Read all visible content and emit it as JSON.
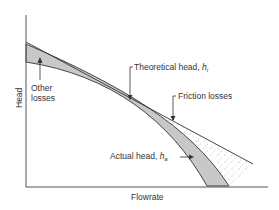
{
  "diagram": {
    "type": "pump performance curve",
    "axes": {
      "x_label": "Flowrate",
      "y_label": "Head"
    },
    "curves": [
      {
        "name": "Theoretical head",
        "symbol": "h",
        "subscript": "i",
        "style": "straight line"
      },
      {
        "name": "Actual head",
        "symbol": "h",
        "subscript": "a",
        "style": "curve"
      }
    ],
    "annotations": {
      "theoretical": {
        "text": "Theoretical head, ",
        "symbol": "h",
        "sub": "i"
      },
      "friction": {
        "text": "Friction losses"
      },
      "other_line1": "Other",
      "other_line2": "losses",
      "actual": {
        "text": "Actual head, ",
        "symbol": "h",
        "sub": "a"
      }
    },
    "colors": {
      "line": "#333333",
      "other_losses_fill": "#c8c8c8",
      "friction_stipple": "#888888"
    }
  }
}
